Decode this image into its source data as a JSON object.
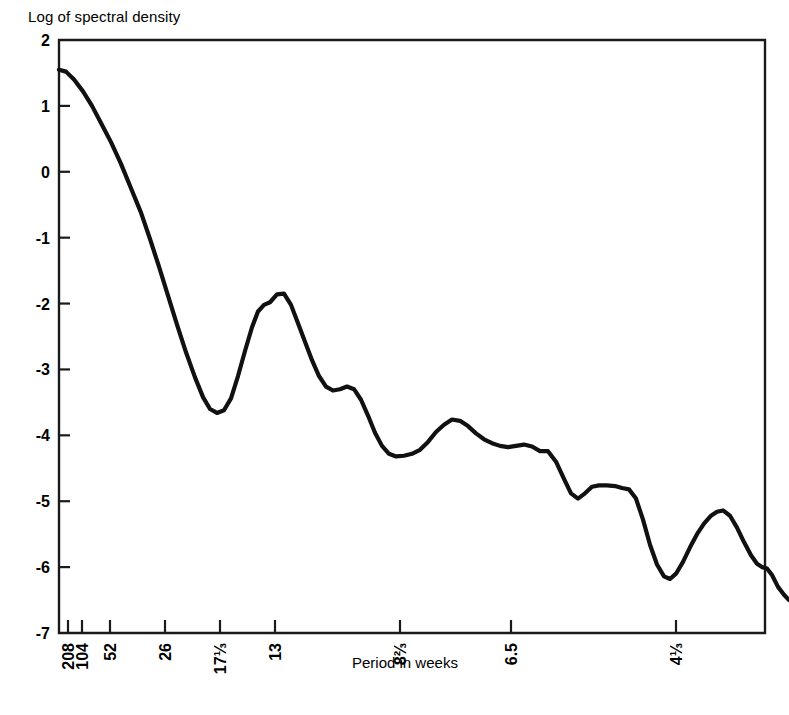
{
  "chart_data": {
    "type": "line",
    "title": "",
    "ylabel": "Log of spectral density",
    "xlabel": "Period in weeks",
    "ylim": [
      -7,
      2
    ],
    "y_ticks": [
      2,
      1,
      0,
      -1,
      -2,
      -3,
      -4,
      -5,
      -6,
      -7
    ],
    "y_tick_labels": [
      "2",
      "1",
      "0",
      "-1",
      "-2",
      "-3",
      "-4",
      "-5",
      "-6",
      "-7"
    ],
    "grid": false,
    "legend": null,
    "x_axis_note": "axis linear in frequency; labels are period in weeks",
    "x_ticks": [
      {
        "label": "208",
        "px": 68
      },
      {
        "label": "104",
        "px": 82
      },
      {
        "label": "52",
        "px": 110
      },
      {
        "label": "26",
        "px": 165
      },
      {
        "label": "17⅓",
        "px": 220
      },
      {
        "label": "13",
        "px": 275
      },
      {
        "label": "8⅔",
        "px": 400
      },
      {
        "label": "6.5",
        "px": 511
      },
      {
        "label": "4⅓",
        "px": 676
      }
    ],
    "series": [
      {
        "name": "log spectral density",
        "points": [
          [
            59,
            1.55
          ],
          [
            66,
            1.52
          ],
          [
            74,
            1.4
          ],
          [
            83,
            1.22
          ],
          [
            92,
            1.0
          ],
          [
            101,
            0.74
          ],
          [
            111,
            0.45
          ],
          [
            121,
            0.12
          ],
          [
            131,
            -0.25
          ],
          [
            141,
            -0.62
          ],
          [
            150,
            -1.02
          ],
          [
            159,
            -1.44
          ],
          [
            168,
            -1.88
          ],
          [
            177,
            -2.32
          ],
          [
            186,
            -2.74
          ],
          [
            195,
            -3.12
          ],
          [
            203,
            -3.42
          ],
          [
            210,
            -3.6
          ],
          [
            217,
            -3.66
          ],
          [
            224,
            -3.62
          ],
          [
            231,
            -3.44
          ],
          [
            238,
            -3.1
          ],
          [
            245,
            -2.72
          ],
          [
            252,
            -2.36
          ],
          [
            258,
            -2.12
          ],
          [
            264,
            -2.02
          ],
          [
            270,
            -1.98
          ],
          [
            277,
            -1.86
          ],
          [
            284,
            -1.85
          ],
          [
            291,
            -2.02
          ],
          [
            298,
            -2.3
          ],
          [
            305,
            -2.58
          ],
          [
            312,
            -2.86
          ],
          [
            319,
            -3.1
          ],
          [
            326,
            -3.26
          ],
          [
            333,
            -3.32
          ],
          [
            340,
            -3.3
          ],
          [
            347,
            -3.26
          ],
          [
            354,
            -3.3
          ],
          [
            361,
            -3.46
          ],
          [
            368,
            -3.7
          ],
          [
            375,
            -3.96
          ],
          [
            382,
            -4.16
          ],
          [
            389,
            -4.28
          ],
          [
            396,
            -4.32
          ],
          [
            404,
            -4.31
          ],
          [
            412,
            -4.28
          ],
          [
            420,
            -4.22
          ],
          [
            428,
            -4.1
          ],
          [
            436,
            -3.95
          ],
          [
            444,
            -3.84
          ],
          [
            452,
            -3.76
          ],
          [
            460,
            -3.78
          ],
          [
            468,
            -3.86
          ],
          [
            476,
            -3.97
          ],
          [
            484,
            -4.06
          ],
          [
            492,
            -4.12
          ],
          [
            500,
            -4.16
          ],
          [
            508,
            -4.18
          ],
          [
            516,
            -4.16
          ],
          [
            524,
            -4.14
          ],
          [
            532,
            -4.17
          ],
          [
            540,
            -4.24
          ],
          [
            548,
            -4.24
          ],
          [
            556,
            -4.4
          ],
          [
            564,
            -4.66
          ],
          [
            571,
            -4.88
          ],
          [
            578,
            -4.96
          ],
          [
            585,
            -4.88
          ],
          [
            592,
            -4.78
          ],
          [
            599,
            -4.76
          ],
          [
            607,
            -4.76
          ],
          [
            615,
            -4.77
          ],
          [
            622,
            -4.8
          ],
          [
            629,
            -4.82
          ],
          [
            636,
            -4.96
          ],
          [
            643,
            -5.28
          ],
          [
            650,
            -5.66
          ],
          [
            657,
            -5.96
          ],
          [
            664,
            -6.14
          ],
          [
            670,
            -6.18
          ],
          [
            676,
            -6.1
          ],
          [
            683,
            -5.92
          ],
          [
            690,
            -5.7
          ],
          [
            697,
            -5.5
          ],
          [
            704,
            -5.34
          ],
          [
            711,
            -5.22
          ],
          [
            717,
            -5.16
          ],
          [
            723,
            -5.14
          ],
          [
            730,
            -5.22
          ],
          [
            737,
            -5.4
          ],
          [
            744,
            -5.62
          ],
          [
            751,
            -5.82
          ],
          [
            757,
            -5.95
          ],
          [
            762,
            -6.0
          ],
          [
            767,
            -6.02
          ],
          [
            772,
            -6.12
          ],
          [
            778,
            -6.3
          ],
          [
            784,
            -6.42
          ],
          [
            789,
            -6.5
          ]
        ]
      }
    ]
  },
  "plot": {
    "frame": {
      "left": 59,
      "top": 40,
      "right": 765,
      "bottom": 633
    },
    "line_color": "#111111",
    "axis_color": "#1a1a1a",
    "background": "#ffffff"
  }
}
